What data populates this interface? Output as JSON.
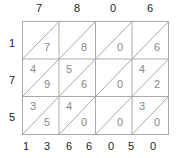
{
  "top_digits": [
    "7",
    "8",
    "0",
    "6"
  ],
  "left_digits": [
    "1",
    "7",
    "5"
  ],
  "cells": [
    [
      {
        "tens": "",
        "ones": "7"
      },
      {
        "tens": "",
        "ones": "8"
      },
      {
        "tens": "",
        "ones": "0"
      },
      {
        "tens": "",
        "ones": "6"
      }
    ],
    [
      {
        "tens": "4",
        "ones": "9"
      },
      {
        "tens": "5",
        "ones": "6"
      },
      {
        "tens": "",
        "ones": "0"
      },
      {
        "tens": "4",
        "ones": "2"
      }
    ],
    [
      {
        "tens": "3",
        "ones": "5"
      },
      {
        "tens": "4",
        "ones": "0"
      },
      {
        "tens": "",
        "ones": "0"
      },
      {
        "tens": "3",
        "ones": "0"
      }
    ]
  ],
  "bottom_digits": [
    "1",
    "3",
    "6",
    "6",
    "0",
    "5",
    "0"
  ],
  "colors": {
    "grid": "#aaaaaa",
    "text": "#222222",
    "cell_text": "#888888"
  }
}
